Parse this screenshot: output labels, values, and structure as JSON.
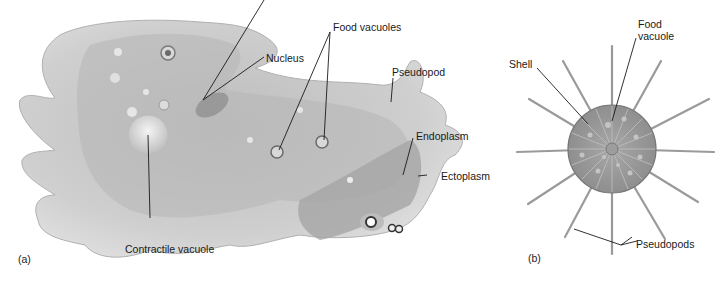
{
  "figure": {
    "panel_a": {
      "marker": "(a)",
      "subject": "amoeba",
      "labels": {
        "nucleus": "Nucleus",
        "food_vacuoles": "Food vacuoles",
        "pseudopod": "Pseudopod",
        "endoplasm": "Endoplasm",
        "ectoplasm": "Ectoplasm",
        "contractile_vacuole": "Contractile vacuole"
      }
    },
    "panel_b": {
      "marker": "(b)",
      "subject": "shelled protozoan",
      "labels": {
        "shell": "Shell",
        "food_vacuole_line1": "Food",
        "food_vacuole_line2": "vacuole",
        "pseudopods": "Pseudopods"
      }
    },
    "colors": {
      "cell_body": "#c9c9c9",
      "endoplasm": "#a9a9a9",
      "ectoplasm": "#dedede",
      "shell": "#9a9a9a",
      "leader_line": "#1a1a1a"
    }
  }
}
